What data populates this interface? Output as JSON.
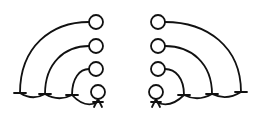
{
  "diagram": {
    "type": "mirrored-tree",
    "stroke_color": "#111111",
    "background": "#ffffff",
    "left_tree": {
      "root": {
        "x": 98,
        "y": 92,
        "r": 7
      },
      "nodes": [
        {
          "x": 96,
          "y": 22,
          "r": 7
        },
        {
          "x": 96,
          "y": 46,
          "r": 7
        },
        {
          "x": 96,
          "y": 69,
          "r": 7
        }
      ],
      "baseline_ticks": [
        {
          "x": 20,
          "y": 93
        },
        {
          "x": 45,
          "y": 94
        },
        {
          "x": 72,
          "y": 95
        }
      ]
    },
    "right_tree": {
      "root": {
        "x": 156,
        "y": 92,
        "r": 7
      },
      "nodes": [
        {
          "x": 158,
          "y": 22,
          "r": 7
        },
        {
          "x": 158,
          "y": 46,
          "r": 7
        },
        {
          "x": 158,
          "y": 69,
          "r": 7
        }
      ],
      "baseline_ticks": [
        {
          "x": 184,
          "y": 95
        },
        {
          "x": 212,
          "y": 94
        },
        {
          "x": 241,
          "y": 92
        }
      ]
    }
  }
}
